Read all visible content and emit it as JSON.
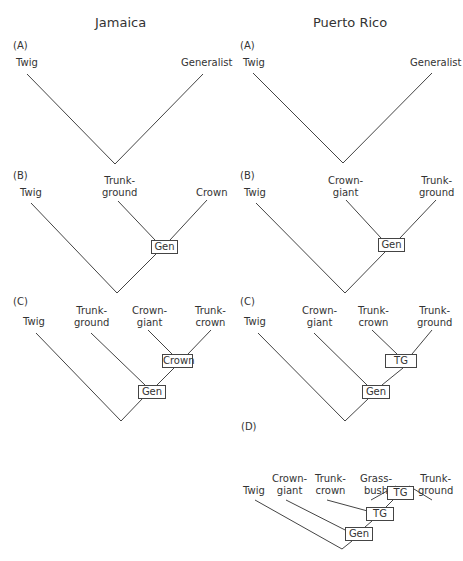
{
  "columns": [
    {
      "title": "Jamaica",
      "panels": [
        {
          "label": "(A)",
          "leaves": [
            "Twig",
            "Generalist"
          ],
          "nodes": []
        },
        {
          "label": "(B)",
          "leaves": [
            "Twig",
            "Trunk-\nground",
            "Crown"
          ],
          "nodes": [
            "Gen"
          ]
        },
        {
          "label": "(C)",
          "leaves": [
            "Twig",
            "Trunk-\nground",
            "Crown-\ngiant",
            "Trunk-\ncrown"
          ],
          "nodes": [
            "Crown",
            "Gen"
          ]
        }
      ]
    },
    {
      "title": "Puerto Rico",
      "panels": [
        {
          "label": "(A)",
          "leaves": [
            "Twig",
            "Generalist"
          ],
          "nodes": []
        },
        {
          "label": "(B)",
          "leaves": [
            "Twig",
            "Crown-\ngiant",
            "Trunk-\nground"
          ],
          "nodes": [
            "Gen"
          ]
        },
        {
          "label": "(C)",
          "leaves": [
            "Twig",
            "Crown-\ngiant",
            "Trunk-\ncrown",
            "Trunk-\nground"
          ],
          "nodes": [
            "TG",
            "Gen"
          ]
        },
        {
          "label": "(D)",
          "leaves": [
            "Twig",
            "Crown-\ngiant",
            "Trunk-\ncrown",
            "Grass-\nbush",
            "Trunk-\nground"
          ],
          "nodes": [
            "TG",
            "TG",
            "Gen"
          ]
        }
      ]
    }
  ],
  "text": {
    "jam_title": "Jamaica",
    "pr_title": "Puerto Rico",
    "lA": "(A)",
    "lB": "(B)",
    "lC": "(C)",
    "lD": "(D)",
    "twig": "Twig",
    "generalist": "Generalist",
    "crown": "Crown",
    "trunk": "Trunk-",
    "ground": "ground",
    "crown_h": "Crown-",
    "giant": "giant",
    "crown_l": "crown",
    "grass": "Grass-",
    "bush": "bush",
    "gen": "Gen",
    "tg": "TG",
    "crown_node": "Crown"
  }
}
